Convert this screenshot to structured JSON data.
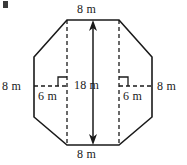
{
  "figure": {
    "shape": "octagon",
    "stroke_color": "#1a1a1a",
    "background_color": "#ffffff",
    "unit": "m",
    "labels": {
      "top_side": "8 m",
      "bottom_side": "8 m",
      "left_side": "8 m",
      "right_side": "8 m",
      "height": "18 m",
      "left_offset": "6 m",
      "right_offset": "6 m"
    },
    "measurements": [
      {
        "name": "top-side",
        "value": 8,
        "unit": "m",
        "text": "8 m"
      },
      {
        "name": "bottom-side",
        "value": 8,
        "unit": "m",
        "text": "8 m"
      },
      {
        "name": "left-side",
        "value": 8,
        "unit": "m",
        "text": "8 m"
      },
      {
        "name": "right-side",
        "value": 8,
        "unit": "m",
        "text": "8 m"
      },
      {
        "name": "vertical-height",
        "value": 18,
        "unit": "m",
        "text": "18 m"
      },
      {
        "name": "left-horizontal-offset",
        "value": 6,
        "unit": "m",
        "text": "6 m"
      },
      {
        "name": "right-horizontal-offset",
        "value": 6,
        "unit": "m",
        "text": "6 m"
      }
    ],
    "annotations": {
      "right_angle_markers": 2,
      "dashed_vertical_lines": 2,
      "dashed_horizontal_lines": 2,
      "double_headed_arrow": "vertical center, 18 m"
    }
  }
}
